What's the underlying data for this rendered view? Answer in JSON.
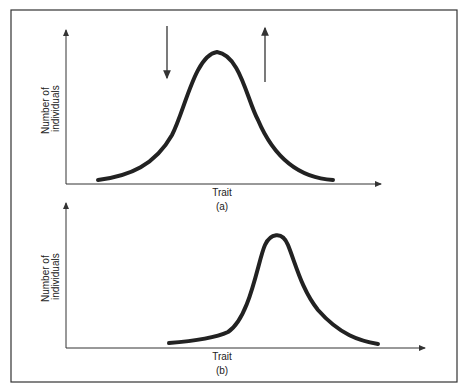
{
  "figure": {
    "panels": [
      {
        "id": "a",
        "caption": "(a)",
        "xlabel": "Trait",
        "ylabel_line1": "Number of",
        "ylabel_line2": "individuals",
        "arrows": [
          {
            "direction": "down",
            "meaning": "selection against left side"
          },
          {
            "direction": "up",
            "meaning": "selection favoring right side"
          }
        ]
      },
      {
        "id": "b",
        "caption": "(b)",
        "xlabel": "Trait",
        "ylabel_line1": "Number of",
        "ylabel_line2": "individuals"
      }
    ]
  },
  "colors": {
    "line": "#222222",
    "frame": "#333333",
    "background": "#ffffff"
  }
}
